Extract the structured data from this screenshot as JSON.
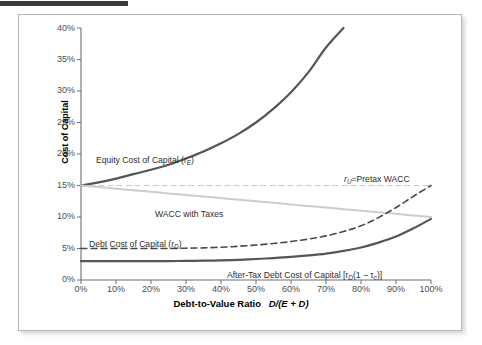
{
  "figure": {
    "top_strip": "dark-rule",
    "background": "#ffffff",
    "border_color": "#b7b7b7"
  },
  "chart_data": {
    "type": "line",
    "title": "",
    "xlabel": "Debt-to-Value Ratio  D/(E + D)",
    "ylabel": "Cost of Capital",
    "xlim": [
      0,
      100
    ],
    "ylim": [
      0,
      40
    ],
    "grid": false,
    "legend": "inline-annotations",
    "xtick_labels": [
      "0%",
      "10%",
      "20%",
      "30%",
      "40%",
      "50%",
      "60%",
      "70%",
      "80%",
      "90%",
      "100%"
    ],
    "xtick_values": [
      0,
      10,
      20,
      30,
      40,
      50,
      60,
      70,
      80,
      90,
      100
    ],
    "ytick_labels": [
      "0%",
      "5%",
      "10%",
      "15%",
      "20%",
      "25%",
      "30%",
      "35%",
      "40%"
    ],
    "ytick_values": [
      0,
      5,
      10,
      15,
      20,
      25,
      30,
      35,
      40
    ],
    "x": [
      0,
      5,
      10,
      15,
      20,
      25,
      30,
      35,
      40,
      45,
      50,
      55,
      60,
      65,
      70,
      75,
      80,
      85,
      90,
      95,
      100
    ],
    "series": [
      {
        "name": "Equity Cost of Capital (rE)",
        "style": "solid",
        "color": "#555555",
        "width": 2.2,
        "values": [
          15.0,
          15.5,
          16.1,
          16.8,
          17.5,
          18.3,
          19.3,
          20.4,
          21.7,
          23.2,
          25.0,
          27.2,
          29.8,
          33.0,
          36.9,
          40.0,
          null,
          null,
          null,
          null,
          null
        ],
        "truncated_at_x": 85,
        "truncated_at_y": 40
      },
      {
        "name": "rU = Pretax WACC",
        "style": "dashed-light",
        "color": "#c9c9c9",
        "width": 1.1,
        "values": [
          15.0,
          15.0,
          15.0,
          15.0,
          15.0,
          15.0,
          15.0,
          15.0,
          15.0,
          15.0,
          15.0,
          15.0,
          15.0,
          15.0,
          15.0,
          15.0,
          15.0,
          15.0,
          15.0,
          15.0,
          15.0
        ]
      },
      {
        "name": "WACC with Taxes",
        "style": "solid",
        "color": "#cccccc",
        "width": 2.0,
        "values": [
          15.0,
          14.75,
          14.5,
          14.25,
          14.0,
          13.75,
          13.5,
          13.25,
          13.0,
          12.75,
          12.5,
          12.25,
          12.0,
          11.75,
          11.5,
          11.25,
          11.0,
          10.75,
          10.5,
          10.25,
          10.0
        ]
      },
      {
        "name": "Debt Cost of Capital (rD)",
        "style": "dashed",
        "color": "#4a4a4a",
        "width": 1.6,
        "values": [
          5.0,
          5.0,
          5.0,
          5.0,
          5.0,
          5.0,
          5.05,
          5.1,
          5.2,
          5.35,
          5.55,
          5.8,
          6.1,
          6.5,
          7.0,
          7.7,
          8.6,
          9.9,
          11.5,
          13.3,
          15.0
        ]
      },
      {
        "name": "After-Tax Debt Cost of Capital [rD(1 - tc)]",
        "style": "solid",
        "color": "#555555",
        "width": 2.2,
        "values": [
          3.0,
          3.0,
          3.0,
          3.0,
          3.0,
          3.0,
          3.03,
          3.06,
          3.12,
          3.21,
          3.33,
          3.48,
          3.66,
          3.9,
          4.2,
          4.62,
          5.16,
          5.94,
          6.9,
          8.2,
          9.7
        ]
      }
    ],
    "annotations": [
      {
        "id": "equity-label",
        "text": "Equity Cost of Capital (",
        "sub": "E",
        "tail": ")",
        "x": 95,
        "y": 147
      },
      {
        "id": "pretax-wacc-label",
        "pre": "r",
        "sub": "U",
        "tail": "=Pretax WACC",
        "x": 343,
        "y": 166
      },
      {
        "id": "wacc-taxes-label",
        "text": "WACC with Taxes",
        "x": 154,
        "y": 201
      },
      {
        "id": "debt-label",
        "text": "Debt Cost of Capital (",
        "sub": "D",
        "tail": ")",
        "x": 88,
        "y": 231
      },
      {
        "id": "aftertax-label",
        "text": "After-Tax Debt Cost of Capital [",
        "sub": "D",
        "tail": "(1 − τc)]",
        "x": 226,
        "y": 262
      }
    ]
  },
  "labels": {
    "y_axis_title": "Cost of Capital",
    "x_axis_title_main": "Debt-to-Value Ratio",
    "x_axis_title_formula": "D/(E + D)",
    "equity": {
      "text": "Equity Cost of Capital (r",
      "sub": "E",
      "after": ")"
    },
    "pretax": {
      "var": "r",
      "sub": "U",
      "after": "=Pretax WACC"
    },
    "wacc_taxes": "WACC with Taxes",
    "debt": {
      "text": "Debt Cost of Capital (r",
      "sub": "D",
      "after": ")"
    },
    "aftertax": {
      "text": "After-Tax Debt Cost of Capital [r",
      "sub": "D",
      "after": "(1 − τ",
      "sub2": "c",
      "after2": ")]"
    }
  },
  "ticks": {
    "y": [
      "40%",
      "35%",
      "30%",
      "25%",
      "20%",
      "15%",
      "10%",
      "5%",
      "0%"
    ],
    "x": [
      "0%",
      "10%",
      "20%",
      "30%",
      "40%",
      "50%",
      "60%",
      "70%",
      "80%",
      "90%",
      "100%"
    ]
  },
  "colors": {
    "dark_curve": "#555555",
    "debt_dashed": "#4a4a4a",
    "wacc_gray": "#cccccc",
    "pretax_gray": "#c9c9c9",
    "axis": "#6e6e6e",
    "tick_text": "#4d4d4d",
    "strip": "#3c3c3c"
  }
}
